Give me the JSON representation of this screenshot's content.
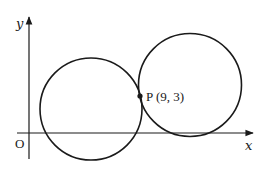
{
  "diagram": {
    "type": "coordinate-geometry",
    "axes": {
      "x_label": "x",
      "y_label": "y",
      "origin_label": "O"
    },
    "point": {
      "name": "P",
      "label": "P (9, 3)",
      "coordinates": [
        9,
        3
      ]
    },
    "circles": [
      {
        "name": "left-circle",
        "note": "crosses both axes region near origin, passes through P"
      },
      {
        "name": "right-circle",
        "note": "touches x-axis, passes through P"
      }
    ],
    "colors": {
      "stroke": "#1a1a1a",
      "background": "#ffffff"
    }
  }
}
